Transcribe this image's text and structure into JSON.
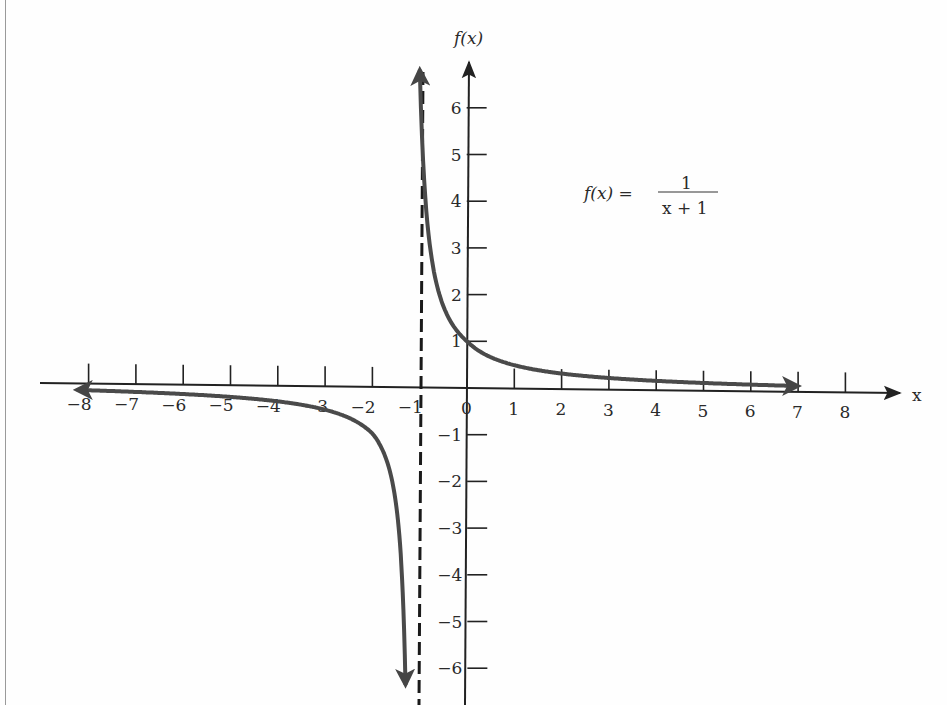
{
  "chart_data": {
    "type": "line",
    "title": "",
    "function_label": {
      "lhs": "f(x) =",
      "numerator": "1",
      "denominator": "x + 1"
    },
    "xlabel": "x",
    "ylabel": "f(x)",
    "xlim": [
      -8.5,
      9
    ],
    "ylim": [
      -6.5,
      6.8
    ],
    "grid": false,
    "legend": "none",
    "x_ticks": [
      "-8",
      "-7",
      "-6",
      "-5",
      "-4",
      "-3",
      "-2",
      "-1",
      "0",
      "1",
      "2",
      "3",
      "4",
      "5",
      "6",
      "7",
      "8"
    ],
    "y_ticks": [
      "6",
      "5",
      "4",
      "3",
      "2",
      "1",
      "-1",
      "-2",
      "-3",
      "-4",
      "-5",
      "-6"
    ],
    "asymptote": {
      "type": "vertical",
      "x": -1,
      "style": "dashed"
    },
    "series": [
      {
        "name": "right branch",
        "x": [
          -0.85,
          -0.8,
          -0.7,
          -0.6,
          -0.5,
          -0.3,
          0,
          0.5,
          1,
          2,
          3,
          4,
          5,
          6,
          7
        ],
        "y": [
          6.67,
          5,
          3.33,
          2.5,
          2,
          1.43,
          1,
          0.67,
          0.5,
          0.33,
          0.25,
          0.2,
          0.17,
          0.14,
          0.125
        ]
      },
      {
        "name": "left branch",
        "x": [
          -8,
          -7,
          -6,
          -5,
          -4,
          -3,
          -2,
          -1.5,
          -1.3,
          -1.2,
          -1.15
        ],
        "y": [
          -0.14,
          -0.17,
          -0.2,
          -0.25,
          -0.33,
          -0.5,
          -1,
          -2,
          -3.33,
          -5,
          -6.67
        ]
      }
    ]
  }
}
